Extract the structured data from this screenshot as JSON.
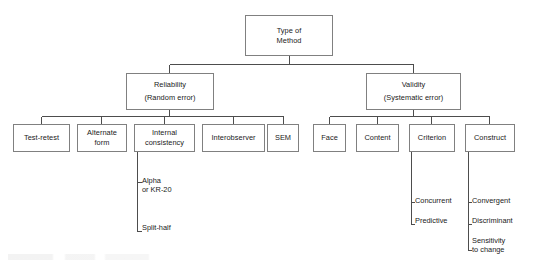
{
  "diagram": {
    "title_node": {
      "id": "type-of-method",
      "lines": [
        "Type of",
        "Method"
      ],
      "x": 245,
      "y": 15,
      "w": 88,
      "h": 41
    },
    "level2": [
      {
        "id": "reliability",
        "lines": [
          "Reliability",
          "(Random error)"
        ],
        "x": 126,
        "y": 73,
        "w": 88,
        "h": 37
      },
      {
        "id": "validity",
        "lines": [
          "Validity",
          "(Systematic error)"
        ],
        "x": 366,
        "y": 73,
        "w": 95,
        "h": 37
      }
    ],
    "level3_reliability": [
      {
        "id": "test-retest",
        "lines": [
          "Test-retest"
        ],
        "x": 13,
        "y": 124,
        "w": 57,
        "h": 28
      },
      {
        "id": "alternate-form",
        "lines": [
          "Alternate",
          "form"
        ],
        "x": 77,
        "y": 124,
        "w": 50,
        "h": 28
      },
      {
        "id": "internal-consistency",
        "lines": [
          "Internal",
          "consistency"
        ],
        "x": 134,
        "y": 124,
        "w": 61,
        "h": 28
      },
      {
        "id": "interobserver",
        "lines": [
          "Interobserver"
        ],
        "x": 202,
        "y": 124,
        "w": 63,
        "h": 28
      },
      {
        "id": "sem",
        "lines": [
          "SEM"
        ],
        "x": 267,
        "y": 124,
        "w": 32,
        "h": 28
      }
    ],
    "level3_validity": [
      {
        "id": "face",
        "lines": [
          "Face"
        ],
        "x": 313,
        "y": 124,
        "w": 33,
        "h": 28
      },
      {
        "id": "content",
        "lines": [
          "Content"
        ],
        "x": 356,
        "y": 124,
        "w": 43,
        "h": 28
      },
      {
        "id": "criterion",
        "lines": [
          "Criterion"
        ],
        "x": 409,
        "y": 124,
        "w": 46,
        "h": 28
      },
      {
        "id": "construct",
        "lines": [
          "Construct"
        ],
        "x": 465,
        "y": 124,
        "w": 50,
        "h": 28
      }
    ],
    "leaves_internal_consistency": [
      {
        "id": "alpha-or-kr20",
        "lines": [
          "Alpha",
          "or KR-20"
        ],
        "x": 142,
        "y": 176
      },
      {
        "id": "split-half",
        "lines": [
          "Split-half"
        ],
        "x": 142,
        "y": 223
      }
    ],
    "leaves_criterion": [
      {
        "id": "concurrent",
        "lines": [
          "Concurrent"
        ],
        "x": 415,
        "y": 196
      },
      {
        "id": "predictive",
        "lines": [
          "Predictive"
        ],
        "x": 415,
        "y": 216
      }
    ],
    "leaves_construct": [
      {
        "id": "convergent",
        "lines": [
          "Convergent"
        ],
        "x": 472,
        "y": 196
      },
      {
        "id": "discriminant",
        "lines": [
          "Discriminant"
        ],
        "x": 472,
        "y": 216
      },
      {
        "id": "sensitivity-to-change",
        "lines": [
          "Sensitivity",
          "to change"
        ],
        "x": 472,
        "y": 236
      }
    ]
  },
  "colors": {
    "box_border": "#808080",
    "connector": "#4d4d4d",
    "text": "#1a1a1a",
    "background": "#ffffff"
  }
}
